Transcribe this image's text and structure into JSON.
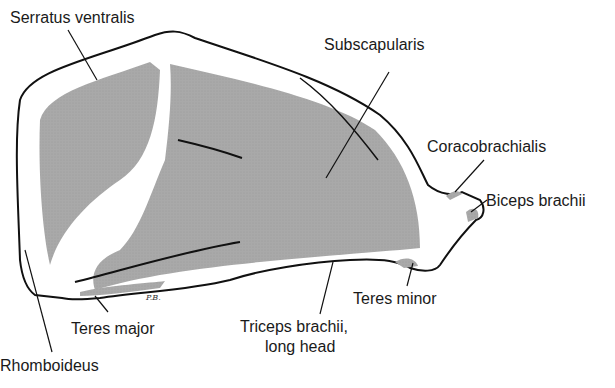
{
  "figure": {
    "signature": "P.B.",
    "colors": {
      "muscle_fill": "#a8a8a8",
      "outline": "#111111",
      "background": "#ffffff"
    }
  },
  "labels": [
    {
      "id": "serratus",
      "text": "Serratus ventralis"
    },
    {
      "id": "subscapularis",
      "text": "Subscapularis"
    },
    {
      "id": "coracobrachialis",
      "text": "Coracobrachialis"
    },
    {
      "id": "biceps",
      "text": "Biceps brachii"
    },
    {
      "id": "teres_minor",
      "text": "Teres minor"
    },
    {
      "id": "triceps_1",
      "text": "Triceps brachii,"
    },
    {
      "id": "triceps_2",
      "text": "long head"
    },
    {
      "id": "teres_major",
      "text": "Teres major"
    },
    {
      "id": "rhomboideus",
      "text": "Rhomboideus"
    }
  ]
}
